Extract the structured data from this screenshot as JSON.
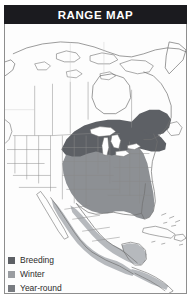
{
  "header": {
    "title": "RANGE MAP"
  },
  "legend": {
    "items": [
      {
        "label": "Breeding",
        "color": "#5d6065",
        "key": "breeding"
      },
      {
        "label": "Winter",
        "color": "#9a9da1",
        "key": "winter"
      },
      {
        "label": "Year-round",
        "color": "#787b80",
        "key": "year-round"
      }
    ]
  },
  "map": {
    "region": "North America",
    "colors": {
      "land": "#fdfdfd",
      "outline": "#6f6f6f",
      "state_line": "#8a8a8a",
      "breeding": "#5d6065",
      "winter": "#b6b9bd",
      "year_round": "#8d9094",
      "lake": "#ffffff",
      "frame": "#8e8e8e",
      "banner": "#1b1b1f"
    },
    "areas": [
      {
        "name": "northern-canada-arctic",
        "shading": "none"
      },
      {
        "name": "western-united-states",
        "shading": "none"
      },
      {
        "name": "great-lakes-northeast",
        "shading": "breeding"
      },
      {
        "name": "eastern-central-united-states",
        "shading": "year-round"
      },
      {
        "name": "mexico-coasts-central-america",
        "shading": "winter"
      },
      {
        "name": "caribbean-islands",
        "shading": "none"
      }
    ]
  }
}
